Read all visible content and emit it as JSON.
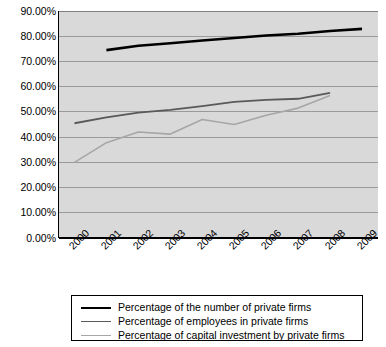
{
  "chart_data": {
    "type": "line",
    "title": "",
    "xlabel": "",
    "ylabel": "",
    "categories": [
      "2000",
      "2001",
      "2002",
      "2003",
      "2004",
      "2005",
      "2006",
      "2007",
      "2008",
      "2009"
    ],
    "ylim": [
      0,
      0.9
    ],
    "ytick_labels": [
      "90.00%",
      "80.00%",
      "70.00%",
      "60.00%",
      "50.00%",
      "40.00%",
      "30.00%",
      "20.00%",
      "10.00%",
      "0.00%"
    ],
    "ytick_values": [
      0.9,
      0.8,
      0.7,
      0.6,
      0.5,
      0.4,
      0.3,
      0.2,
      0.1,
      0.0
    ],
    "grid": true,
    "legend_position": "bottom",
    "plot_background": "#d9d9d9",
    "gridline_color": "#9a9a9a",
    "axis_color": "#000000",
    "series": [
      {
        "name": "Percentage of the number of private firms",
        "color": "#000000",
        "width": 2.6,
        "x": [
          "2001",
          "2002",
          "2003",
          "2004",
          "2005",
          "2006",
          "2007",
          "2008",
          "2009"
        ],
        "values": [
          0.745,
          0.762,
          0.772,
          0.783,
          0.793,
          0.803,
          0.81,
          0.821,
          0.829
        ]
      },
      {
        "name": "Percentage of employees in private firms",
        "color": "#595959",
        "width": 1.8,
        "x": [
          "2000",
          "2001",
          "2002",
          "2003",
          "2004",
          "2005",
          "2006",
          "2007",
          "2008"
        ],
        "values": [
          0.455,
          0.478,
          0.497,
          0.508,
          0.523,
          0.54,
          0.548,
          0.552,
          0.575
        ]
      },
      {
        "name": "Percentage of capital investment by private firms",
        "color": "#a6a6a6",
        "width": 1.6,
        "x": [
          "2000",
          "2001",
          "2002",
          "2003",
          "2004",
          "2005",
          "2006",
          "2007",
          "2008"
        ],
        "values": [
          0.3,
          0.378,
          0.42,
          0.412,
          0.47,
          0.45,
          0.487,
          0.515,
          0.565
        ]
      }
    ]
  },
  "legend": {
    "items": [
      {
        "label": "Percentage of the number of private firms"
      },
      {
        "label": "Percentage of employees in private firms"
      },
      {
        "label": "Percentage of capital investment by private firms"
      }
    ]
  }
}
